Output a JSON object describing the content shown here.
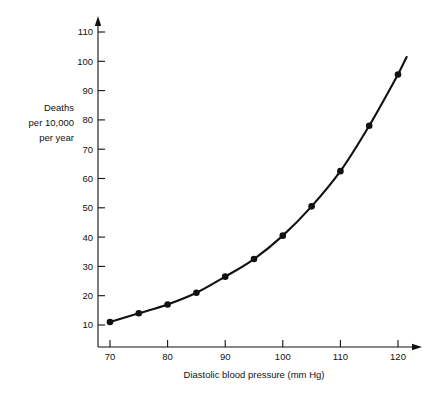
{
  "chart_data": {
    "type": "line",
    "title": "",
    "subtitle": "",
    "xlabel": "Diastolic blood pressure (mm Hg)",
    "ylabel": "Deaths per 10,000 per year",
    "ylabel_lines": [
      "Deaths",
      "per 10,000",
      "per year"
    ],
    "x": [
      70,
      75,
      80,
      85,
      90,
      95,
      100,
      105,
      110,
      115,
      120
    ],
    "values": [
      11,
      14,
      17,
      21,
      26.5,
      32.5,
      40.5,
      50.5,
      62.5,
      78,
      95.5
    ],
    "series": [
      {
        "name": "Deaths per 10,000 per year",
        "values": [
          11,
          14,
          17,
          21,
          26.5,
          32.5,
          40.5,
          50.5,
          62.5,
          78,
          95.5
        ]
      }
    ],
    "xlim": [
      65,
      123
    ],
    "ylim": [
      0,
      116
    ],
    "xticks": [
      70,
      80,
      90,
      100,
      110,
      120
    ],
    "xtick_labels": [
      "70",
      "80",
      "90",
      "100",
      "110",
      "120"
    ],
    "yticks": [
      10,
      20,
      30,
      40,
      50,
      60,
      70,
      80,
      90,
      100,
      110
    ],
    "ytick_labels": [
      "10",
      "20",
      "30",
      "40",
      "50",
      "60",
      "70",
      "80",
      "90",
      "100",
      "110"
    ],
    "grid": false,
    "legend": false,
    "legend_position": "none",
    "marker": "filled-circle",
    "line_color": "#111111",
    "marker_color": "#111111",
    "background_color": "#ffffff",
    "axis_arrows": true,
    "annotations": []
  }
}
